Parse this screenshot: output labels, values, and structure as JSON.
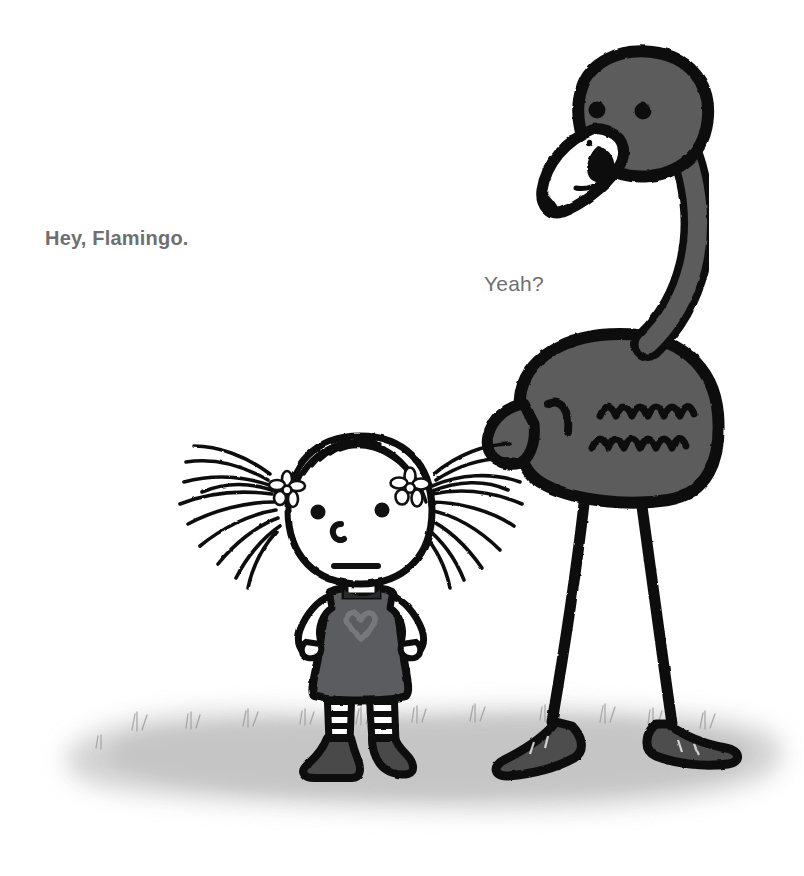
{
  "page": {
    "background_color": "#ffffff",
    "width": 804,
    "height": 876
  },
  "captions": [
    {
      "id": "hey",
      "text": "Hey, Flamingo.",
      "speaker": "girl",
      "color": "#6f6f6f",
      "x": 45,
      "y": 227
    },
    {
      "id": "yeah",
      "text": "Yeah?",
      "speaker": "flamingo",
      "color": "#6f6f6f",
      "x": 484,
      "y": 272
    }
  ],
  "illustration": {
    "style": "black ink line drawing with gray wash",
    "palette": {
      "ink": "#111111",
      "flamingo_body": "#5c5c5c",
      "flamingo_foot": "#4d4d4d",
      "dress": "#5a5c60",
      "heart": "#6e6e72",
      "shoe": "#48484a",
      "sock_stripe": "#9a9a9e",
      "ground_wash": "#c9c9c9",
      "paper": "#ffffff",
      "beak": "#ffffff",
      "skin": "#ffffff"
    },
    "characters": [
      {
        "name": "flamingo",
        "description": "tall gray flamingo standing with long neck curved, large hooked beak, two black dot eyes, feather squiggles on wing, thin black legs with webbed feet",
        "height_px": 720
      },
      {
        "name": "girl",
        "description": "small girl with spiky sketchy pigtails, two white flowers in hair, dot eyes, c-shaped nose, straight mouth, gray dress with heart, hands on hips, striped socks and dark shoes",
        "height_px": 345
      }
    ],
    "ground": {
      "name": "ground-shadow",
      "description": "soft gray watercolor ground wash with small grass tufts",
      "color": "#c9c9c9"
    }
  }
}
